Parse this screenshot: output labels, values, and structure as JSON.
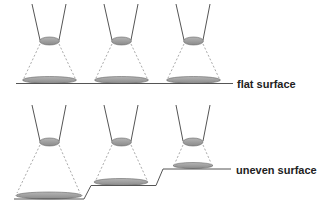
{
  "diagram": {
    "colors": {
      "line": "#555555",
      "lens_fill": "#999999",
      "spot_fill": "#999999",
      "dashed": "#aaaaaa",
      "text": "#222222"
    },
    "labels": {
      "flat": "flat surface",
      "uneven": "uneven surface"
    },
    "rows": [
      {
        "name": "flat",
        "lenses": 3,
        "spot_size": "uniform"
      },
      {
        "name": "uneven",
        "lenses": 3,
        "spot_size": "varying (large, medium, small)"
      }
    ]
  }
}
